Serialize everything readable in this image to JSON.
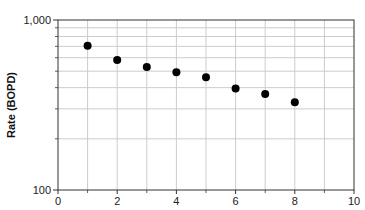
{
  "chart_data": {
    "type": "scatter",
    "title": "",
    "xlabel": "",
    "ylabel": "Rate (BOPD)",
    "x": [
      1,
      2,
      3,
      4,
      5,
      6,
      7,
      8
    ],
    "series": [
      {
        "name": "Rate",
        "values": [
          706,
          582,
          529,
          492,
          460,
          396,
          367,
          328
        ]
      }
    ],
    "xlim": [
      0,
      10
    ],
    "ylim": [
      100,
      1000
    ],
    "yscale": "log",
    "x_ticks": [
      0,
      2,
      4,
      6,
      8,
      10
    ],
    "x_tick_labels": [
      "0",
      "2",
      "4",
      "6",
      "8",
      "10"
    ],
    "x_minor_ticks": [
      1,
      3,
      5,
      7,
      9
    ],
    "y_ticks": [
      100,
      1000
    ],
    "y_tick_labels": [
      "100",
      "1,000"
    ],
    "y_gridlines": [
      200,
      300,
      400,
      500,
      600,
      700,
      800,
      900
    ],
    "x_gridlines": [
      1,
      2,
      3,
      4,
      5,
      6,
      7,
      8,
      9
    ],
    "grid": true,
    "legend": null
  },
  "style": {
    "marker_color": "#000000",
    "grid_color": "#cccccc",
    "axis_color": "#333333",
    "background": "#ffffff"
  }
}
